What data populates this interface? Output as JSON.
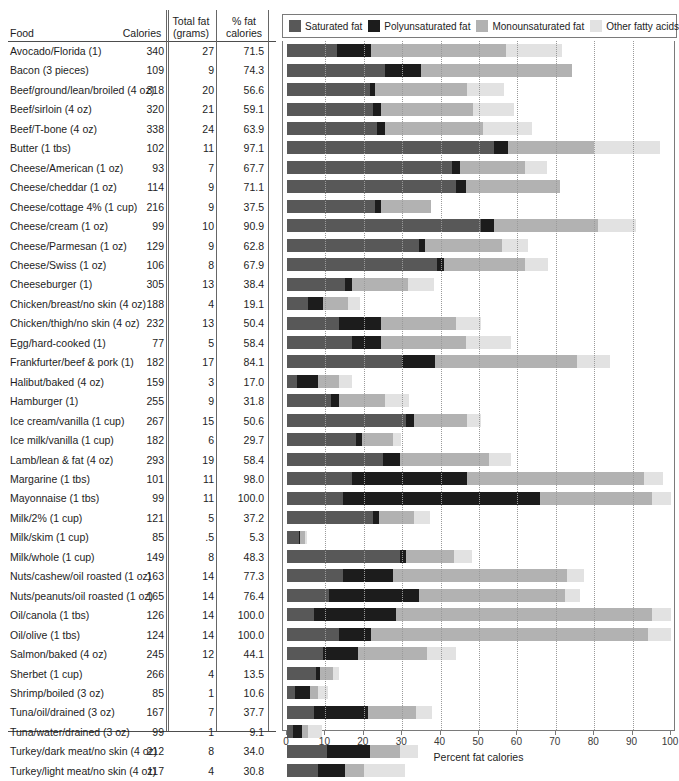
{
  "table": {
    "headers": {
      "food": "Food",
      "calories": "Calories",
      "total_fat_l1": "Total fat",
      "total_fat_l2": "(grams)",
      "pct_fat_l1": "% fat",
      "pct_fat_l2": "calories"
    }
  },
  "legend": {
    "items": [
      {
        "label": "Saturated fat",
        "color": "#585858"
      },
      {
        "label": "Polyunsaturated fat",
        "color": "#1c1c1c"
      },
      {
        "label": "Monounsaturated fat",
        "color": "#b2b2b2"
      },
      {
        "label": "Other fatty acids",
        "color": "#e2e2e2"
      }
    ]
  },
  "axis": {
    "title": "Percent fat calories",
    "ticks": [
      0,
      10,
      20,
      30,
      40,
      50,
      60,
      70,
      80,
      90,
      100
    ]
  },
  "chart_data": {
    "type": "bar",
    "title": "",
    "xlabel": "Percent fat calories",
    "ylabel": "Food",
    "xlim": [
      0,
      100
    ],
    "grid": true,
    "legend_position": "top",
    "stacked": true,
    "series": [
      {
        "name": "Saturated fat",
        "color": "#585858"
      },
      {
        "name": "Polyunsaturated fat",
        "color": "#1c1c1c"
      },
      {
        "name": "Monounsaturated fat",
        "color": "#b2b2b2"
      },
      {
        "name": "Other fatty acids",
        "color": "#e2e2e2"
      }
    ],
    "columns": [
      "Food",
      "Calories",
      "Total fat (grams)",
      "% fat calories"
    ],
    "rows": [
      {
        "food": "Avocado/Florida (1)",
        "calories": "340",
        "total_fat": "27",
        "pct_fat": "71.5",
        "segments": [
          13.0,
          9.0,
          35.0,
          14.5
        ]
      },
      {
        "food": "Bacon (3 pieces)",
        "calories": "109",
        "total_fat": "9",
        "pct_fat": "74.3",
        "segments": [
          25.5,
          9.5,
          39.3,
          0.0
        ]
      },
      {
        "food": "Beef/ground/lean/broiled (4 oz)",
        "calories": "318",
        "total_fat": "20",
        "pct_fat": "56.6",
        "segments": [
          21.5,
          1.5,
          24.0,
          9.6
        ]
      },
      {
        "food": "Beef/sirloin (4 oz)",
        "calories": "320",
        "total_fat": "21",
        "pct_fat": "59.1",
        "segments": [
          22.5,
          2.0,
          24.0,
          10.6
        ]
      },
      {
        "food": "Beef/T-bone (4 oz)",
        "calories": "338",
        "total_fat": "24",
        "pct_fat": "63.9",
        "segments": [
          23.5,
          2.0,
          25.5,
          12.9
        ]
      },
      {
        "food": "Butter (1 tbs)",
        "calories": "102",
        "total_fat": "11",
        "pct_fat": "97.1",
        "segments": [
          54.0,
          3.5,
          22.5,
          17.1
        ]
      },
      {
        "food": "Cheese/American (1 oz)",
        "calories": "93",
        "total_fat": "7",
        "pct_fat": "67.7",
        "segments": [
          43.0,
          2.0,
          17.0,
          5.7
        ]
      },
      {
        "food": "Cheese/cheddar (1 oz)",
        "calories": "114",
        "total_fat": "9",
        "pct_fat": "71.1",
        "segments": [
          44.0,
          2.5,
          24.6,
          0.0
        ]
      },
      {
        "food": "Cheese/cottage 4% (1 cup)",
        "calories": "216",
        "total_fat": "9",
        "pct_fat": "37.5",
        "segments": [
          23.0,
          1.5,
          13.0,
          0.0
        ]
      },
      {
        "food": "Cheese/cream (1 oz)",
        "calories": "99",
        "total_fat": "10",
        "pct_fat": "90.9",
        "segments": [
          50.5,
          3.5,
          27.0,
          9.9
        ]
      },
      {
        "food": "Cheese/Parmesan (1 oz)",
        "calories": "129",
        "total_fat": "9",
        "pct_fat": "62.8",
        "segments": [
          34.5,
          1.5,
          20.0,
          6.8
        ]
      },
      {
        "food": "Cheese/Swiss (1 oz)",
        "calories": "106",
        "total_fat": "8",
        "pct_fat": "67.9",
        "segments": [
          39.0,
          2.0,
          21.0,
          5.9
        ]
      },
      {
        "food": "Cheeseburger (1)",
        "calories": "305",
        "total_fat": "13",
        "pct_fat": "38.4",
        "segments": [
          15.0,
          2.0,
          14.5,
          6.9
        ]
      },
      {
        "food": "Chicken/breast/no skin (4 oz)",
        "calories": "188",
        "total_fat": "4",
        "pct_fat": "19.1",
        "segments": [
          5.5,
          4.0,
          6.5,
          3.1
        ]
      },
      {
        "food": "Chicken/thigh/no skin (4 oz)",
        "calories": "232",
        "total_fat": "13",
        "pct_fat": "50.4",
        "segments": [
          13.5,
          11.0,
          19.5,
          6.4
        ]
      },
      {
        "food": "Egg/hard-cooked (1)",
        "calories": "77",
        "total_fat": "5",
        "pct_fat": "58.4",
        "segments": [
          17.0,
          7.5,
          22.0,
          11.9
        ]
      },
      {
        "food": "Frankfurter/beef & pork (1)",
        "calories": "182",
        "total_fat": "17",
        "pct_fat": "84.1",
        "segments": [
          30.0,
          8.5,
          37.0,
          8.6
        ]
      },
      {
        "food": "Halibut/baked (4 oz)",
        "calories": "159",
        "total_fat": "3",
        "pct_fat": "17.0",
        "segments": [
          2.5,
          5.5,
          5.5,
          3.5
        ]
      },
      {
        "food": "Hamburger (1)",
        "calories": "255",
        "total_fat": "9",
        "pct_fat": "31.8",
        "segments": [
          11.5,
          2.0,
          12.0,
          6.3
        ]
      },
      {
        "food": "Ice cream/vanilla (1 cup)",
        "calories": "267",
        "total_fat": "15",
        "pct_fat": "50.6",
        "segments": [
          31.0,
          2.0,
          14.0,
          3.6
        ]
      },
      {
        "food": "Ice milk/vanilla (1 cup)",
        "calories": "182",
        "total_fat": "6",
        "pct_fat": "29.7",
        "segments": [
          18.0,
          1.5,
          8.0,
          2.2
        ]
      },
      {
        "food": "Lamb/lean & fat (4 oz)",
        "calories": "293",
        "total_fat": "19",
        "pct_fat": "58.4",
        "segments": [
          25.0,
          4.5,
          23.0,
          5.9
        ]
      },
      {
        "food": "Margarine (1 tbs)",
        "calories": "101",
        "total_fat": "11",
        "pct_fat": "98.0",
        "segments": [
          17.0,
          30.0,
          46.0,
          5.0
        ]
      },
      {
        "food": "Mayonnaise (1 tbs)",
        "calories": "99",
        "total_fat": "11",
        "pct_fat": "100.0",
        "segments": [
          14.5,
          51.5,
          29.0,
          5.0
        ]
      },
      {
        "food": "Milk/2% (1 cup)",
        "calories": "121",
        "total_fat": "5",
        "pct_fat": "37.2",
        "segments": [
          22.5,
          1.5,
          9.0,
          4.2
        ]
      },
      {
        "food": "Milk/skim (1 cup)",
        "calories": "85",
        "total_fat": ".5",
        "pct_fat": "5.3",
        "segments": [
          3.2,
          0.3,
          1.2,
          0.6
        ]
      },
      {
        "food": "Milk/whole (1 cup)",
        "calories": "149",
        "total_fat": "8",
        "pct_fat": "48.3",
        "segments": [
          29.5,
          1.5,
          12.5,
          4.8
        ]
      },
      {
        "food": "Nuts/cashew/oil roasted (1 oz)",
        "calories": "163",
        "total_fat": "14",
        "pct_fat": "77.3",
        "segments": [
          14.5,
          13.0,
          45.5,
          4.3
        ]
      },
      {
        "food": "Nuts/peanuts/oil roasted (1 oz)",
        "calories": "165",
        "total_fat": "14",
        "pct_fat": "76.4",
        "segments": [
          11.0,
          23.5,
          38.0,
          3.9
        ]
      },
      {
        "food": "Oil/canola (1 tbs)",
        "calories": "126",
        "total_fat": "14",
        "pct_fat": "100.0",
        "segments": [
          7.0,
          21.5,
          66.5,
          5.0
        ]
      },
      {
        "food": "Oil/olive (1 tbs)",
        "calories": "124",
        "total_fat": "14",
        "pct_fat": "100.0",
        "segments": [
          13.5,
          8.5,
          72.0,
          6.0
        ]
      },
      {
        "food": "Salmon/baked (4 oz)",
        "calories": "245",
        "total_fat": "12",
        "pct_fat": "44.1",
        "segments": [
          9.5,
          9.0,
          18.0,
          7.6
        ]
      },
      {
        "food": "Sherbet (1 cup)",
        "calories": "266",
        "total_fat": "4",
        "pct_fat": "13.5",
        "segments": [
          7.5,
          1.0,
          3.5,
          1.5
        ]
      },
      {
        "food": "Shrimp/boiled (3 oz)",
        "calories": "85",
        "total_fat": "1",
        "pct_fat": "10.6",
        "segments": [
          2.0,
          4.0,
          2.0,
          2.6
        ]
      },
      {
        "food": "Tuna/oil/drained (3 oz)",
        "calories": "167",
        "total_fat": "7",
        "pct_fat": "37.7",
        "segments": [
          7.0,
          14.0,
          12.5,
          4.2
        ]
      },
      {
        "food": "Tuna/water/drained (3 oz)",
        "calories": "99",
        "total_fat": "1",
        "pct_fat": "9.1",
        "segments": [
          1.5,
          2.5,
          1.5,
          3.6
        ]
      },
      {
        "food": "Turkey/dark meat/no skin (4 oz)",
        "calories": "212",
        "total_fat": "8",
        "pct_fat": "34.0",
        "segments": [
          10.5,
          11.0,
          8.0,
          4.5
        ]
      },
      {
        "food": "Turkey/light meat/no skin (4 oz)",
        "calories": "117",
        "total_fat": "4",
        "pct_fat": "30.8",
        "segments": [
          8.0,
          7.0,
          5.0,
          10.8
        ]
      }
    ]
  }
}
